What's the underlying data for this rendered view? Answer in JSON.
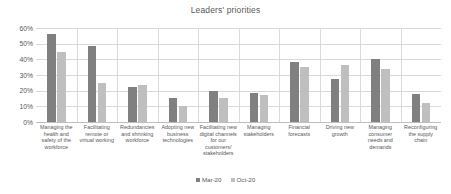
{
  "chart_data": {
    "type": "bar",
    "title": "Leaders' priorities",
    "xlabel": "",
    "ylabel": "",
    "ylim": [
      0,
      60
    ],
    "ytick_labels": [
      "60%",
      "50%",
      "40%",
      "30%",
      "20%",
      "10%",
      "0%"
    ],
    "ytick_values": [
      60,
      50,
      40,
      30,
      20,
      10,
      0
    ],
    "grid": true,
    "legend_position": "bottom",
    "categories": [
      "Managing the health and safety of the workforce",
      "Facilitating remote or virtual working",
      "Redundancies and shrinking workforce",
      "Adopting new business technologies",
      "Facilitating new digital channels for our customers/ stakeholders",
      "Managing stakeholders",
      "Financial forecasts",
      "Driving new growth",
      "Managing consumer needs and demands",
      "Reconfiguring the supply chain"
    ],
    "series": [
      {
        "name": "Mar-20",
        "color": "#808080",
        "values": [
          56,
          48.5,
          22.5,
          15.5,
          20,
          18.5,
          38.5,
          27.5,
          40,
          18
        ]
      },
      {
        "name": "Oct-20",
        "color": "#bfbfbf",
        "values": [
          44.5,
          25,
          23.5,
          10.5,
          15.5,
          17,
          35,
          36.5,
          34,
          12
        ]
      }
    ]
  },
  "legend": {
    "items": [
      {
        "label": "Mar-20"
      },
      {
        "label": "Oct-20"
      }
    ]
  },
  "colors": {
    "series_1": "#808080",
    "series_2": "#bfbfbf",
    "grid": "#d9d9d9",
    "text": "#595959",
    "background": "#ffffff"
  }
}
